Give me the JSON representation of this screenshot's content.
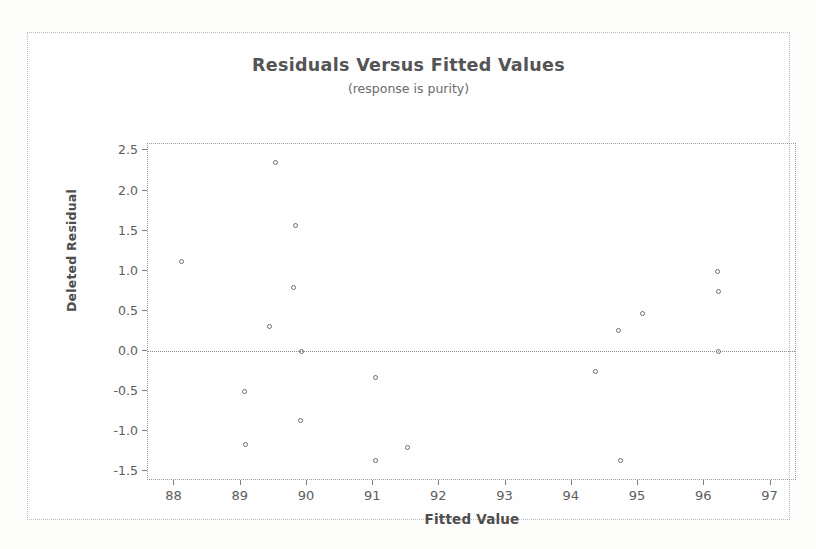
{
  "chart_data": {
    "type": "scatter",
    "title": "Residuals Versus Fitted Values",
    "subtitle": "(response is purity)",
    "xlabel": "Fitted Value",
    "ylabel": "Deleted Residual",
    "xlim": [
      87.6,
      97.4
    ],
    "ylim": [
      -1.62,
      2.58
    ],
    "xticks": [
      88,
      89,
      90,
      91,
      92,
      93,
      94,
      95,
      96,
      97
    ],
    "xtick_labels": [
      "88",
      "89",
      "90",
      "91",
      "92",
      "93",
      "94",
      "95",
      "96",
      "97"
    ],
    "yticks": [
      2.5,
      2.0,
      1.5,
      1.0,
      0.5,
      0.0,
      -0.5,
      -1.0,
      -1.5
    ],
    "ytick_labels": [
      "2.5",
      "2.0",
      "1.5",
      "1.0",
      "0.5",
      "0.0",
      "-0.5",
      "-1.0",
      "-1.5"
    ],
    "grid": false,
    "legend": "none",
    "reference_lines": [
      {
        "axis": "y",
        "value": 0.0,
        "style": "dotted"
      }
    ],
    "marker": {
      "shape": "circle",
      "filled": false,
      "size": 5,
      "color": "#6e6e78"
    },
    "points": [
      {
        "x": 88.1,
        "y": 1.12
      },
      {
        "x": 89.06,
        "y": -0.5
      },
      {
        "x": 89.07,
        "y": -1.16
      },
      {
        "x": 89.52,
        "y": 2.35
      },
      {
        "x": 89.43,
        "y": 0.31
      },
      {
        "x": 89.82,
        "y": 1.57
      },
      {
        "x": 89.79,
        "y": 0.79
      },
      {
        "x": 89.92,
        "y": 0.0
      },
      {
        "x": 89.9,
        "y": -0.87
      },
      {
        "x": 91.03,
        "y": -0.33
      },
      {
        "x": 91.04,
        "y": -1.37
      },
      {
        "x": 91.52,
        "y": -1.2
      },
      {
        "x": 94.35,
        "y": -0.25
      },
      {
        "x": 94.7,
        "y": 0.26
      },
      {
        "x": 94.73,
        "y": -1.37
      },
      {
        "x": 95.07,
        "y": 0.47
      },
      {
        "x": 96.2,
        "y": 0.99
      },
      {
        "x": 96.21,
        "y": 0.74
      },
      {
        "x": 96.22,
        "y": 0.0
      }
    ]
  },
  "axes": {
    "x_title": "Fitted Value",
    "y_title": "Deleted Residual"
  },
  "colors": {
    "marker": "#6e6e78",
    "frame": "#9a9a9a",
    "text": "#545454",
    "background": "#fefefe"
  }
}
